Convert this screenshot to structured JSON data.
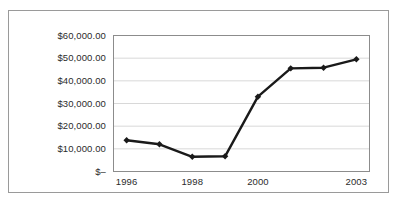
{
  "chart_data": {
    "type": "line",
    "title": "",
    "subtitle": "",
    "xlabel": "",
    "ylabel": "",
    "grid": "horizontal",
    "legend": "none",
    "x": [
      1996,
      1997,
      1998,
      1999,
      2000,
      2001,
      2002,
      2003
    ],
    "categories": [
      "1996",
      "1997",
      "1998",
      "1999",
      "2000",
      "2001",
      "2002",
      "2003"
    ],
    "x_tick_labels": [
      "1996",
      "1998",
      "2000",
      "2003"
    ],
    "x_tick_values": [
      1996,
      1998,
      2000,
      2003
    ],
    "y_tick_labels": [
      "$–",
      "$10,000.00",
      "$20,000.00",
      "$30,000.00",
      "$40,000.00",
      "$50,000.00",
      "$60,000.00"
    ],
    "y_tick_values": [
      0,
      10000,
      20000,
      30000,
      40000,
      50000,
      60000
    ],
    "ylim": [
      0,
      60000
    ],
    "xlim": [
      1995.6,
      2003.4
    ],
    "series": [
      {
        "name": "Value",
        "marker": "diamond",
        "color": "#1a1a1a",
        "values": [
          13800,
          12000,
          6500,
          6700,
          33000,
          45500,
          45800,
          49500
        ]
      }
    ]
  },
  "axes": {
    "y_labels": [
      {
        "text": "$60,000.00",
        "value": 60000
      },
      {
        "text": "$50,000.00",
        "value": 50000
      },
      {
        "text": "$40,000.00",
        "value": 40000
      },
      {
        "text": "$30,000.00",
        "value": 30000
      },
      {
        "text": "$20,000.00",
        "value": 20000
      },
      {
        "text": "$10,000.00",
        "value": 10000
      },
      {
        "text": "$–",
        "value": 0
      }
    ],
    "x_labels": [
      {
        "text": "1996",
        "value": 1996
      },
      {
        "text": "1998",
        "value": 1998
      },
      {
        "text": "2000",
        "value": 2000
      },
      {
        "text": "2003",
        "value": 2003
      }
    ]
  },
  "style": {
    "series_color": "#1a1a1a",
    "gridline_color": "#d8d8d8",
    "plot_border_color": "#8c8c8c",
    "outer_border_color": "#9a9a9a",
    "background_color": "#ffffff",
    "text_color": "#2b2b2b"
  }
}
